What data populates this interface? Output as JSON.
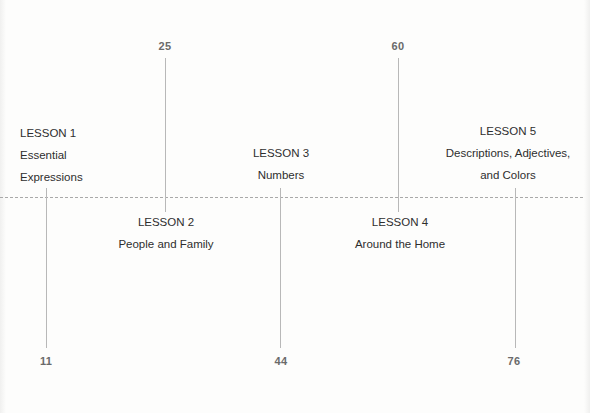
{
  "diagram": {
    "type": "timeline",
    "axis_style": "dashed",
    "colors": {
      "axis": "#a9a9a9",
      "connector": "#b8b8b8",
      "page_number": "#6a6a6a",
      "label": "#2e2e2e",
      "background": "#fdfdfc"
    },
    "lessons": [
      {
        "heading": "LESSON 1",
        "lines": [
          "Essential",
          "Expressions"
        ],
        "page": "11",
        "label_side": "above",
        "page_side": "below"
      },
      {
        "heading": "LESSON 2",
        "lines": [
          "People and Family"
        ],
        "page": "25",
        "label_side": "below",
        "page_side": "above"
      },
      {
        "heading": "LESSON 3",
        "lines": [
          "Numbers"
        ],
        "page": "44",
        "label_side": "above",
        "page_side": "below"
      },
      {
        "heading": "LESSON 4",
        "lines": [
          "Around the Home"
        ],
        "page": "60",
        "label_side": "below",
        "page_side": "above"
      },
      {
        "heading": "LESSON 5",
        "lines": [
          "Descriptions, Adjectives,",
          "and Colors"
        ],
        "page": "76",
        "label_side": "above",
        "page_side": "below"
      }
    ]
  }
}
